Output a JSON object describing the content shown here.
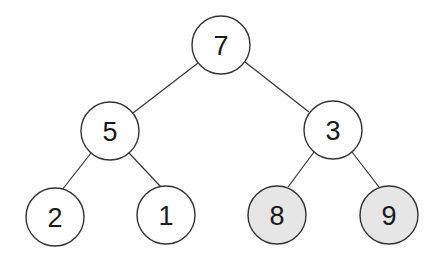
{
  "diagram": {
    "type": "binary-tree",
    "colors": {
      "stroke": "#333333",
      "default_fill": "#ffffff",
      "highlight_fill": "#e6e6e6"
    },
    "nodes": [
      {
        "id": "n7",
        "label": "7",
        "x": 221,
        "y": 45,
        "highlighted": false
      },
      {
        "id": "n5",
        "label": "5",
        "x": 110,
        "y": 131,
        "highlighted": false
      },
      {
        "id": "n3",
        "label": "3",
        "x": 333,
        "y": 130,
        "highlighted": false
      },
      {
        "id": "n2",
        "label": "2",
        "x": 55,
        "y": 217,
        "highlighted": false
      },
      {
        "id": "n1",
        "label": "1",
        "x": 166,
        "y": 215,
        "highlighted": false
      },
      {
        "id": "n8",
        "label": "8",
        "x": 277,
        "y": 215,
        "highlighted": true
      },
      {
        "id": "n9",
        "label": "9",
        "x": 389,
        "y": 215,
        "highlighted": true
      }
    ],
    "edges": [
      {
        "from": "7",
        "to": "5"
      },
      {
        "from": "7",
        "to": "3"
      },
      {
        "from": "5",
        "to": "2"
      },
      {
        "from": "5",
        "to": "1"
      },
      {
        "from": "3",
        "to": "8"
      },
      {
        "from": "3",
        "to": "9"
      }
    ]
  }
}
